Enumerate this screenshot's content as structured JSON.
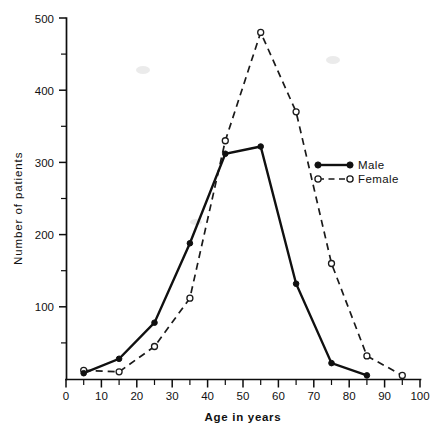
{
  "chart_data": {
    "type": "line",
    "title": "",
    "xlabel": "Age in years",
    "ylabel": "Number of patients",
    "xlim": [
      0,
      100
    ],
    "ylim": [
      0,
      500
    ],
    "grid": false,
    "legend_position": "right-middle",
    "x_ticks_major": [
      0,
      10,
      20,
      30,
      40,
      50,
      60,
      70,
      80,
      90,
      100
    ],
    "x_tick_labels": [
      "0",
      "10",
      "20",
      "30",
      "40",
      "50",
      "60",
      "70",
      "80",
      "90",
      "100"
    ],
    "x_ticks_minor": [
      5,
      15,
      25,
      35,
      45,
      55,
      65,
      75,
      85,
      95
    ],
    "y_ticks_major": [
      0,
      100,
      200,
      300,
      400,
      500
    ],
    "y_tick_labels": [
      "",
      "100",
      "200",
      "300",
      "400",
      "500"
    ],
    "y_ticks_minor": [
      50,
      150,
      250,
      350,
      450
    ],
    "x": [
      5,
      15,
      25,
      35,
      45,
      55,
      65,
      75,
      85,
      95
    ],
    "series": [
      {
        "name": "Male",
        "marker": "filled-circle",
        "line": "solid",
        "color": "#101010",
        "values": [
          8,
          28,
          78,
          188,
          312,
          322,
          132,
          22,
          5,
          null
        ]
      },
      {
        "name": "Female",
        "marker": "open-circle",
        "line": "dashed",
        "color": "#1a1a1a",
        "values": [
          12,
          10,
          45,
          112,
          330,
          480,
          370,
          160,
          32,
          5
        ]
      }
    ]
  },
  "legend": {
    "items": [
      {
        "label": "Male",
        "style": "solid-filled"
      },
      {
        "label": "Female",
        "style": "dashed-open"
      }
    ]
  },
  "axes": {
    "x_title": "Age in years",
    "y_title": "Number of patients"
  }
}
